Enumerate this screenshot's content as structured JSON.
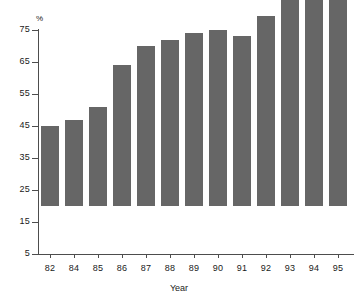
{
  "chart_data": {
    "type": "bar",
    "title": "",
    "xlabel": "Year",
    "ylabel": "%",
    "categories": [
      "82",
      "84",
      "85",
      "86",
      "87",
      "88",
      "89",
      "90",
      "91",
      "92",
      "93",
      "94",
      "95"
    ],
    "values": [
      30,
      32,
      36,
      49,
      55,
      57,
      59,
      60,
      58,
      64.5,
      70,
      74,
      74
    ],
    "ylim": [
      5,
      75
    ],
    "yticks": [
      5,
      15,
      25,
      35,
      45,
      55,
      65,
      75
    ],
    "ytick_labels": [
      "5",
      "15",
      "25",
      "35",
      "45",
      "55",
      "65",
      "75"
    ],
    "grid": false,
    "legend": false,
    "bar_color": "#666666",
    "axis_color": "#4d4d4d",
    "background_color": "#ffffff"
  }
}
